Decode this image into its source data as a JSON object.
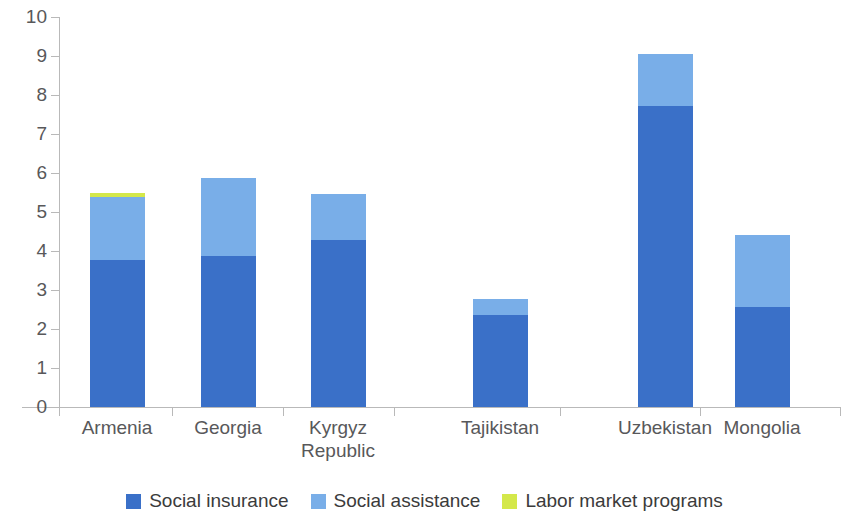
{
  "chart_data": {
    "type": "bar",
    "stacked": true,
    "title": "",
    "subtitle": "",
    "xlabel": "",
    "ylabel": "",
    "ylim": [
      0,
      10
    ],
    "ytick_step": 1,
    "yticks": [
      "10",
      "9",
      "8",
      "7",
      "6",
      "5",
      "4",
      "3",
      "2",
      "1",
      "0"
    ],
    "grid": false,
    "legend_position": "bottom",
    "categories": [
      "Armenia",
      "Georgia",
      "Kyrgyz Republic",
      "Tajikistan",
      "Uzbekistan",
      "Mongolia"
    ],
    "category_lines": [
      [
        "Armenia"
      ],
      [
        "Georgia"
      ],
      [
        "Kyrgyz",
        "Republic"
      ],
      [
        "Tajikistan"
      ],
      [
        "Uzbekistan"
      ],
      [
        "Mongolia"
      ]
    ],
    "series": [
      {
        "name": "Social insurance",
        "color": "#3a70c8",
        "values": [
          3.77,
          3.87,
          4.28,
          2.36,
          7.73,
          2.56
        ]
      },
      {
        "name": "Social assistance",
        "color": "#79aee8",
        "values": [
          1.61,
          2.0,
          1.17,
          0.41,
          1.32,
          1.86
        ]
      },
      {
        "name": "Labor market programs",
        "color": "#d4e84a",
        "values": [
          0.12,
          0,
          0,
          0,
          0,
          0
        ]
      }
    ],
    "totals": [
      5.5,
      5.87,
      5.45,
      2.77,
      9.05,
      4.42
    ]
  },
  "legend": {
    "items": [
      {
        "label": "Social insurance",
        "color": "#3a70c8",
        "swatch": "legend-swatch-social-insurance"
      },
      {
        "label": "Social assistance",
        "color": "#79aee8",
        "swatch": "legend-swatch-social-assistance"
      },
      {
        "label": "Labor market programs",
        "color": "#d4e84a",
        "swatch": "legend-swatch-labor-market-programs"
      }
    ]
  }
}
